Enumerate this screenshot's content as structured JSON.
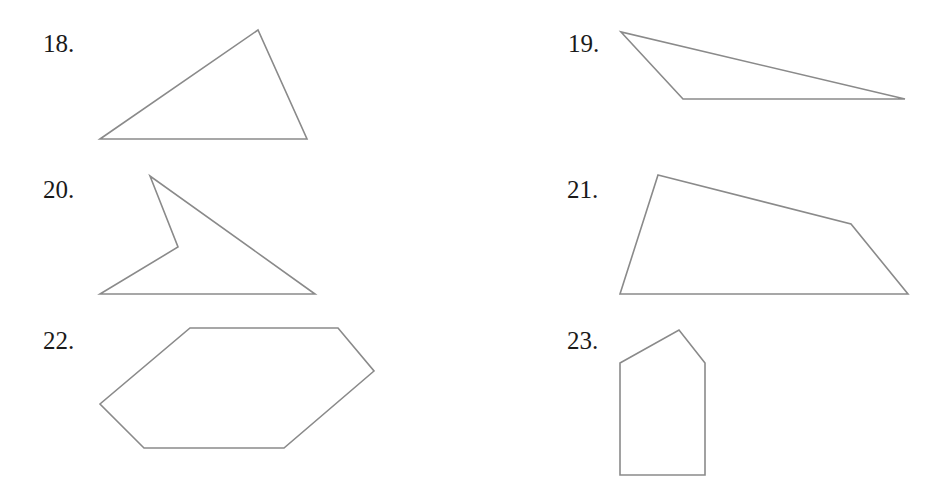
{
  "problems": [
    {
      "number": "18.",
      "label_pos": [
        43,
        31
      ],
      "shape": "triangle",
      "points": [
        [
          100,
          139
        ],
        [
          258,
          30
        ],
        [
          307,
          139
        ]
      ]
    },
    {
      "number": "19.",
      "label_pos": [
        568,
        31
      ],
      "shape": "triangle",
      "points": [
        [
          621,
          32
        ],
        [
          683,
          99
        ],
        [
          905,
          99
        ]
      ]
    },
    {
      "number": "20.",
      "label_pos": [
        43,
        177
      ],
      "shape": "concave-quadrilateral",
      "points": [
        [
          150,
          176
        ],
        [
          178,
          247
        ],
        [
          100,
          294
        ],
        [
          315,
          294
        ]
      ]
    },
    {
      "number": "21.",
      "label_pos": [
        567,
        177
      ],
      "shape": "quadrilateral",
      "points": [
        [
          658,
          175
        ],
        [
          851,
          224
        ],
        [
          908,
          294
        ],
        [
          620,
          294
        ]
      ]
    },
    {
      "number": "22.",
      "label_pos": [
        43,
        328
      ],
      "shape": "hexagon",
      "points": [
        [
          190,
          328
        ],
        [
          338,
          328
        ],
        [
          374,
          371
        ],
        [
          284,
          448
        ],
        [
          144,
          448
        ],
        [
          100,
          404
        ]
      ]
    },
    {
      "number": "23.",
      "label_pos": [
        567,
        328
      ],
      "shape": "pentagon",
      "points": [
        [
          620,
          363
        ],
        [
          679,
          330
        ],
        [
          705,
          363
        ],
        [
          705,
          475
        ],
        [
          620,
          475
        ]
      ]
    }
  ],
  "colors": {
    "stroke": "#8a8a8a",
    "text": "#1a1a1a",
    "background": "#ffffff"
  }
}
